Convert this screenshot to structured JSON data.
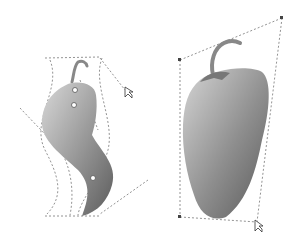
{
  "figure": {
    "colors": {
      "background": "#ffffff",
      "pepper_light": "#cfcfcf",
      "pepper_dark": "#6a6a6a",
      "guide": "#777777",
      "node": "#ffffff"
    }
  },
  "left_object": {
    "label": "envelope-distorted-pepper"
  },
  "right_object": {
    "label": "perspective-distorted-pepper"
  }
}
